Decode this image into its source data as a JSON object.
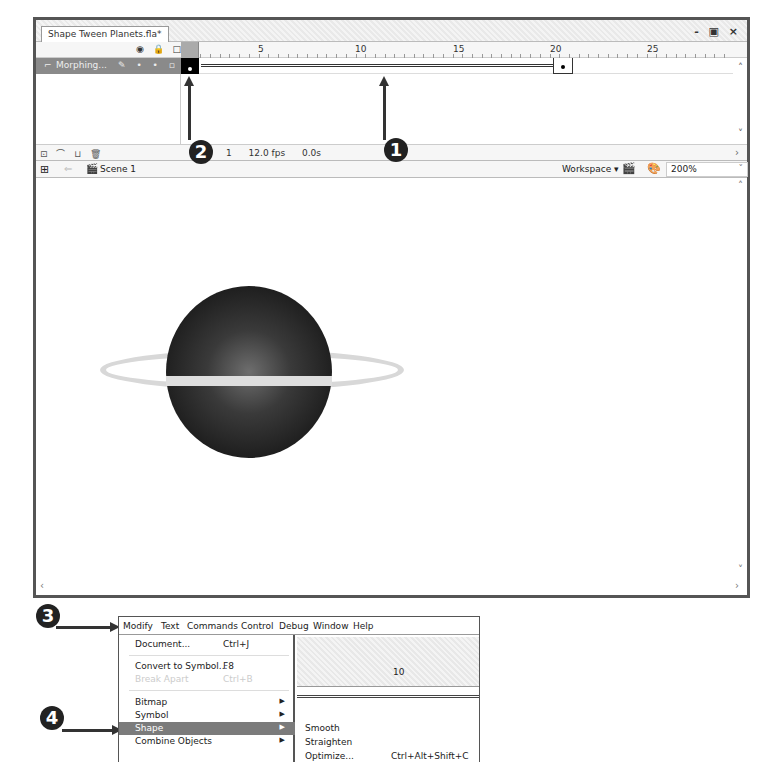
{
  "window": {
    "doc_tab": "Shape Tween Planets.fla*",
    "controls": "- ▣ ×"
  },
  "timeline": {
    "layer_header_icons": "◉ 🔒 □",
    "frame_numbers": [
      {
        "label": "1",
        "left": 2
      },
      {
        "label": "5",
        "left": 77
      },
      {
        "label": "10",
        "left": 174
      },
      {
        "label": "15",
        "left": 272
      },
      {
        "label": "20",
        "left": 369
      },
      {
        "label": "25",
        "left": 466
      }
    ],
    "layer": {
      "name": "Morphing...",
      "controls": "✎ • • ▫"
    },
    "footer_buttons": "⊡ ⌒ ⊔ 🗑",
    "status": {
      "current_frame": "1",
      "frame_rate": "12.0 fps",
      "elapsed": "0.0s"
    }
  },
  "edit_bar": {
    "scene_label": "Scene 1",
    "workspace_label": "Workspace ▾",
    "zoom_value": "200%"
  },
  "callouts": [
    "1",
    "2",
    "3",
    "4"
  ],
  "menu_screenshot": {
    "menubar": [
      "Modify",
      "Text",
      "Commands",
      "Control",
      "Debug",
      "Window",
      "Help"
    ],
    "modify_menu": [
      {
        "label": "Document...",
        "shortcut": "Ctrl+J"
      },
      {
        "label": "Convert to Symbol...",
        "shortcut": "F8"
      },
      {
        "label": "Break Apart",
        "shortcut": "Ctrl+B",
        "disabled": true
      },
      {
        "label": "Bitmap",
        "submenu": true
      },
      {
        "label": "Symbol",
        "submenu": true
      },
      {
        "label": "Shape",
        "submenu": true,
        "highlighted": true
      },
      {
        "label": "Combine Objects",
        "submenu": true
      }
    ],
    "shape_submenu": [
      {
        "label": "Smooth",
        "shortcut": ""
      },
      {
        "label": "Straighten",
        "shortcut": ""
      },
      {
        "label": "Optimize...",
        "shortcut": "Ctrl+Alt+Shift+C"
      }
    ],
    "background_frame_number": "10"
  },
  "colors": {
    "layer_highlight": "#8a8a8a",
    "menu_highlight": "#7b7b7b",
    "callout_bg": "#222222",
    "planet_dark": "#111111",
    "ring": "#d8d8d8"
  }
}
